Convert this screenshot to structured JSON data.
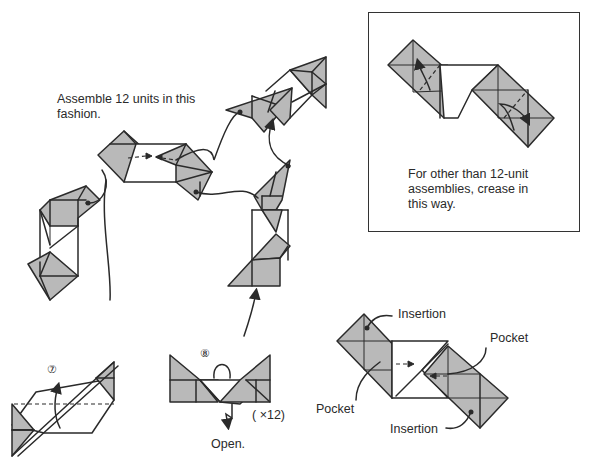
{
  "diagram": {
    "main_assembly": {
      "caption_line1": "Assemble 12 units in this",
      "caption_line2": "fashion."
    },
    "inset": {
      "caption_line1": "For other than 12-unit",
      "caption_line2": "assemblies, crease in",
      "caption_line3": "this way."
    },
    "steps": [
      {
        "number": "⑦",
        "label": ""
      },
      {
        "number": "⑧",
        "label": "Open.",
        "multiplier": "( ×12)"
      }
    ],
    "joint_detail": {
      "labels": {
        "insertion_top": "Insertion",
        "pocket_right": "Pocket",
        "pocket_left": "Pocket",
        "insertion_bottom": "Insertion"
      }
    },
    "colors": {
      "shaded_face": "#b9b9b9",
      "line": "#2a2a2a",
      "background": "#ffffff"
    }
  }
}
